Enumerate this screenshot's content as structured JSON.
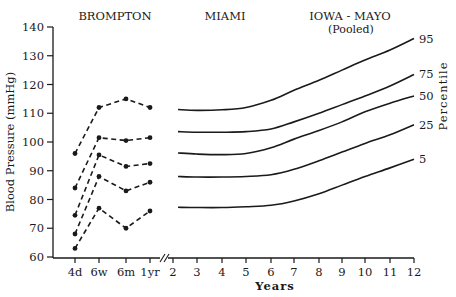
{
  "chart_data": {
    "type": "line",
    "title": "",
    "xlabel": "Years",
    "ylabel": "Blood Pressure (mmHg)",
    "right_label": "Percentile",
    "ylim": [
      60,
      140
    ],
    "yticks": [
      60,
      70,
      80,
      90,
      100,
      110,
      120,
      130,
      140
    ],
    "grid": false,
    "sections": [
      {
        "name": "BROMPTON",
        "style": "dashed-with-markers"
      },
      {
        "name": "MIAMI",
        "style": "solid"
      },
      {
        "name": "IOWA - MAYO",
        "subtitle": "(Pooled)",
        "style": "solid"
      }
    ],
    "infant_x": [
      "4d",
      "6w",
      "6m",
      "1yr"
    ],
    "year_x": [
      2,
      3,
      4,
      5,
      6,
      7,
      8,
      9,
      10,
      11,
      12
    ],
    "axis_break_between": [
      "1yr",
      "2"
    ],
    "brompton_series": [
      {
        "percentile": "95",
        "values": [
          96,
          112,
          115,
          112
        ]
      },
      {
        "percentile": "75",
        "values": [
          84,
          101.5,
          100.5,
          101.5
        ]
      },
      {
        "percentile": "50",
        "values": [
          74.5,
          95.5,
          91.5,
          92.5
        ]
      },
      {
        "percentile": "25",
        "values": [
          68,
          88,
          83,
          86
        ]
      },
      {
        "percentile": "5",
        "values": [
          63,
          77,
          70,
          76
        ]
      }
    ],
    "curves": [
      {
        "percentile": "95",
        "x": [
          2,
          3,
          4,
          5,
          6,
          7,
          8,
          9,
          10,
          11,
          12
        ],
        "values": [
          111.3,
          111,
          111.2,
          112,
          114.5,
          118,
          121.5,
          125,
          128.5,
          132,
          136
        ]
      },
      {
        "percentile": "75",
        "x": [
          2,
          3,
          4,
          5,
          6,
          7,
          8,
          9,
          10,
          11,
          12
        ],
        "values": [
          103.6,
          103.4,
          103.4,
          103.6,
          104.5,
          107,
          110,
          113,
          116,
          119.5,
          123.5
        ]
      },
      {
        "percentile": "50",
        "x": [
          2,
          3,
          4,
          5,
          6,
          7,
          8,
          9,
          10,
          11,
          12
        ],
        "values": [
          96.2,
          95.8,
          95.6,
          96,
          98,
          101,
          104,
          107,
          110.5,
          113.5,
          116
        ]
      },
      {
        "percentile": "25",
        "x": [
          2,
          3,
          4,
          5,
          6,
          7,
          8,
          9,
          10,
          11,
          12
        ],
        "values": [
          88,
          87.8,
          87.8,
          88,
          88.6,
          90.5,
          93.5,
          96.5,
          99.5,
          102.5,
          106
        ]
      },
      {
        "percentile": "5",
        "x": [
          2,
          3,
          4,
          5,
          6,
          7,
          8,
          9,
          10,
          11,
          12
        ],
        "values": [
          77.3,
          77.2,
          77.2,
          77.5,
          78,
          79.5,
          82,
          85,
          88,
          91,
          94
        ]
      }
    ],
    "percentile_labels": [
      "95",
      "75",
      "50",
      "25",
      "5"
    ]
  }
}
